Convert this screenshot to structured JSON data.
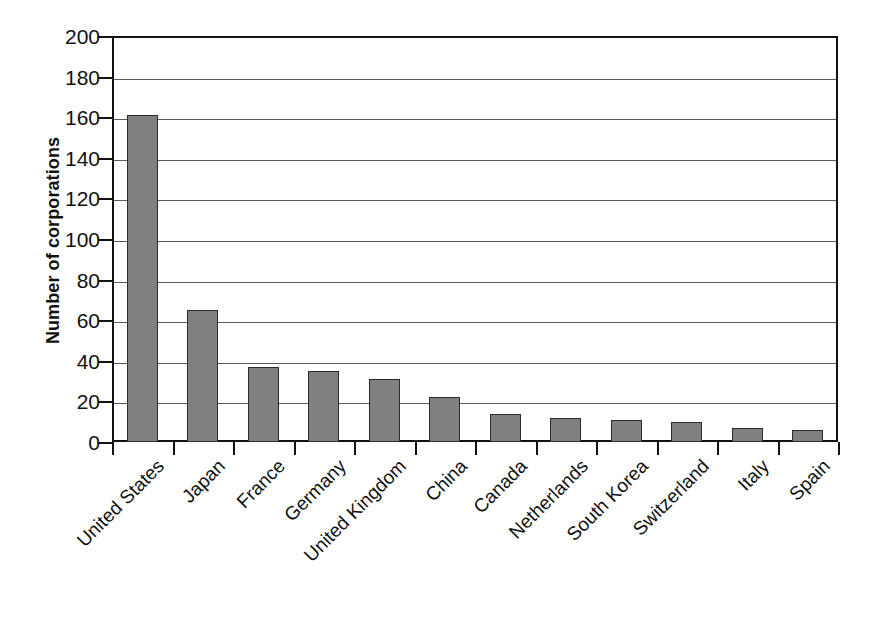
{
  "chart_data": {
    "type": "bar",
    "title": "",
    "subtitle": "",
    "xlabel": "",
    "ylabel": "Number of corporations",
    "ylim": [
      0,
      200
    ],
    "yticks": [
      0,
      20,
      40,
      60,
      80,
      100,
      120,
      140,
      160,
      180,
      200
    ],
    "ytick_labels": [
      "0",
      "20",
      "40",
      "60",
      "80",
      "100",
      "120",
      "140",
      "160",
      "180",
      "200"
    ],
    "grid": true,
    "legend": null,
    "legend_position": "none",
    "bar_color": "#808080",
    "bar_edge_color": "#2b2b2b",
    "axis_color": "#111111",
    "gridline_color": "#5a5a5a",
    "background_color": "#ffffff",
    "categories": [
      "United States",
      "Japan",
      "France",
      "Germany",
      "United Kingdom",
      "China",
      "Canada",
      "Netherlands",
      "South Korea",
      "Switzerland",
      "Italy",
      "Spain"
    ],
    "values": [
      161,
      65,
      37,
      35,
      31,
      22,
      14,
      12,
      11,
      10,
      7,
      6
    ],
    "series": [
      {
        "name": "Number of corporations",
        "values": [
          161,
          65,
          37,
          35,
          31,
          22,
          14,
          12,
          11,
          10,
          7,
          6
        ]
      }
    ]
  }
}
